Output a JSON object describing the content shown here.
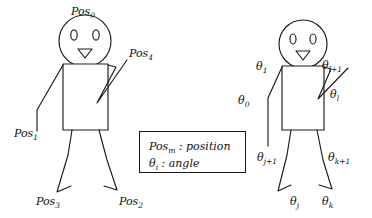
{
  "diagram": {
    "stroke_color": "#1a1a1a",
    "background_color": "#ffffff",
    "legend": {
      "position_label": "Pos",
      "position_subscript": "m",
      "position_separator": " : position",
      "angle_label": "θ",
      "angle_subscript": "i",
      "angle_separator": " : angle"
    },
    "left_figure": {
      "name": "position-labeled-figure",
      "labels": [
        {
          "id": "pos0",
          "base": "Pos",
          "sub": "0",
          "x": 71,
          "y": 6
        },
        {
          "id": "pos4",
          "base": "Pos",
          "sub": "4",
          "x": 129,
          "y": 48
        },
        {
          "id": "pos1",
          "base": "Pos",
          "sub": "1",
          "x": 14,
          "y": 128
        },
        {
          "id": "pos3",
          "base": "Pos",
          "sub": "3",
          "x": 36,
          "y": 196
        },
        {
          "id": "pos2",
          "base": "Pos",
          "sub": "2",
          "x": 119,
          "y": 196
        }
      ]
    },
    "right_figure": {
      "name": "angle-labeled-figure",
      "labels": [
        {
          "id": "theta1",
          "base": "θ",
          "sub": "1",
          "x": 256,
          "y": 61
        },
        {
          "id": "thetal1",
          "base": "θ",
          "sub": "l+1",
          "x": 322,
          "y": 60
        },
        {
          "id": "thetal",
          "base": "θ",
          "sub": "l",
          "x": 330,
          "y": 89
        },
        {
          "id": "theta0",
          "base": "θ",
          "sub": "0",
          "x": 238,
          "y": 95
        },
        {
          "id": "thetaj1",
          "base": "θ",
          "sub": "j+1",
          "x": 257,
          "y": 152
        },
        {
          "id": "thetak1",
          "base": "θ",
          "sub": "k+1",
          "x": 328,
          "y": 152
        },
        {
          "id": "thetaj",
          "base": "θ",
          "sub": "j",
          "x": 290,
          "y": 196
        },
        {
          "id": "thetak",
          "base": "θ",
          "sub": "k",
          "x": 322,
          "y": 196
        }
      ]
    }
  }
}
